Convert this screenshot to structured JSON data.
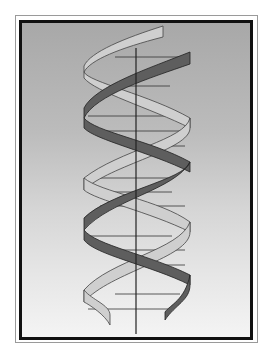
{
  "figure": {
    "colors": {
      "background_top": "#a8a8a8",
      "background_bottom": "#f4f4f4",
      "strand_light": "#cfcfcf",
      "strand_dark": "#5a5a5a",
      "axis": "#222222",
      "frame": "#111111"
    }
  }
}
